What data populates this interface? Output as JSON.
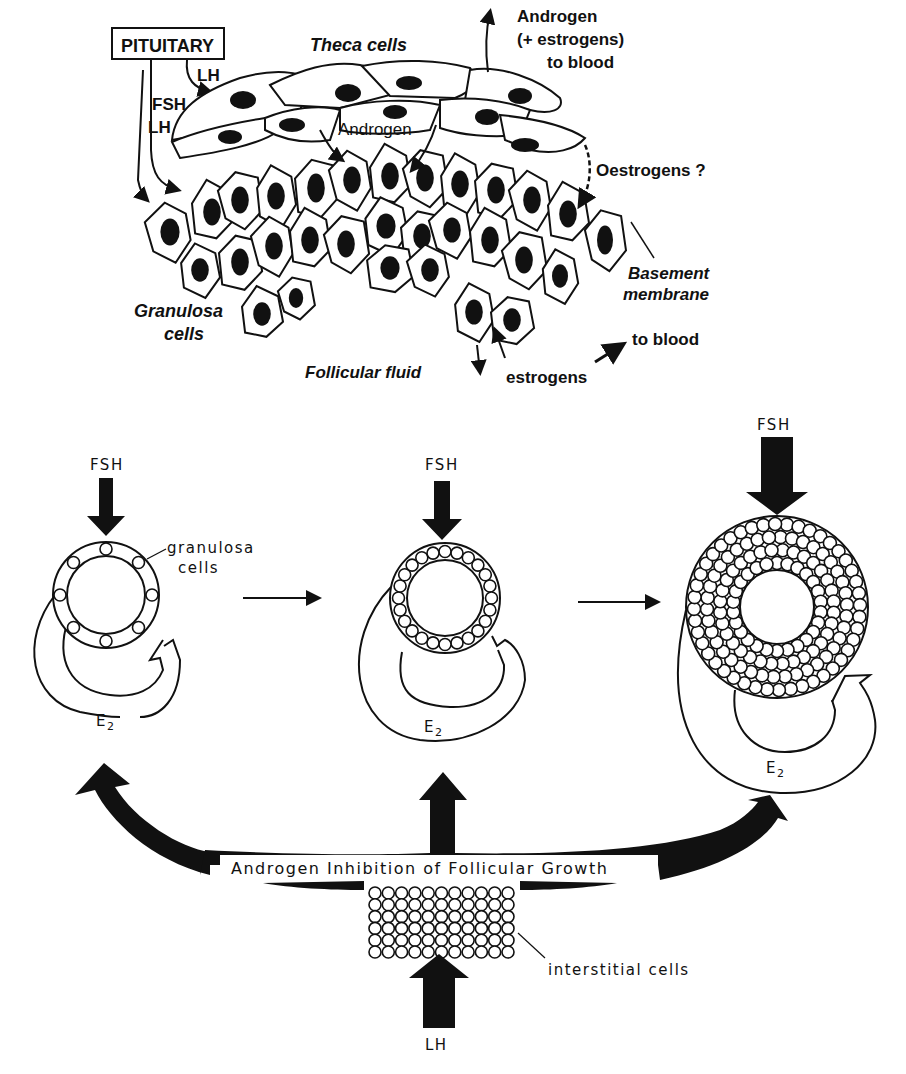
{
  "top_panel": {
    "pituitary_label": "PITUITARY",
    "lh_label_1": "LH",
    "fsh_label": "FSH",
    "lh_label_2": "LH",
    "theca_label": "Theca cells",
    "androgen_inner_label": "Androgen",
    "androgen_blood_lines": [
      "Androgen",
      "(+  estrogens)",
      "to blood"
    ],
    "oestrogens_label": "Oestrogens ?",
    "basement_lines": [
      "Basement",
      "membrane"
    ],
    "granulosa_lines": [
      "Granulosa",
      "cells"
    ],
    "follicular_fluid_label": "Follicular fluid",
    "estrogens_label": "estrogens",
    "to_blood_label": "to blood"
  },
  "bottom_panel": {
    "stages": [
      {
        "fsh_label": "FSH",
        "e2_label": "E",
        "e2_sub": "2",
        "cell_count": 8
      },
      {
        "fsh_label": "FSH",
        "e2_label": "E",
        "e2_sub": "2",
        "cell_count": 24
      },
      {
        "fsh_label": "FSH",
        "e2_label": "E",
        "e2_sub": "2",
        "cell_count": 180
      }
    ],
    "granulosa_lines": [
      "granulosa",
      "cells"
    ],
    "inhibition_label": "Androgen Inhibition of Follicular Growth",
    "interstitial_label": "interstitial cells",
    "lh_label": "LH",
    "interstitial_grid": {
      "rows": 6,
      "cols": 11
    }
  }
}
